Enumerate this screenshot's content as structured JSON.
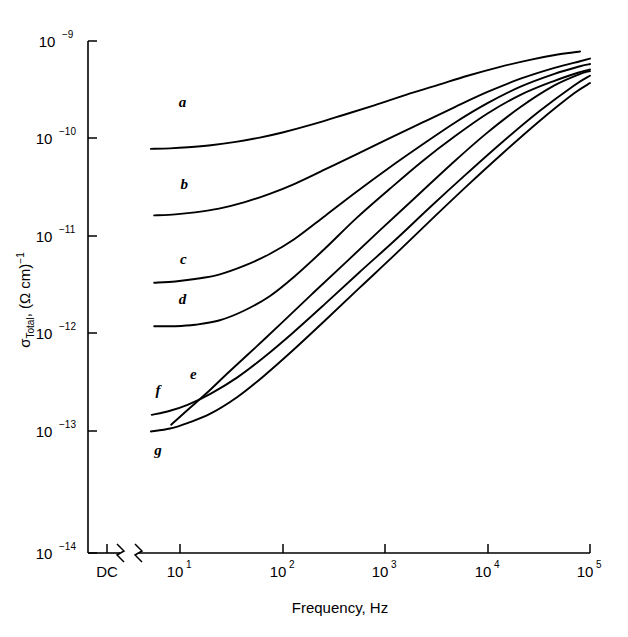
{
  "figure": {
    "background": "#ffffff",
    "ink_color": "#000000"
  },
  "axes": {
    "y_title_main": "σ",
    "y_title_sub": "Total",
    "y_title_rest": ", (Ω  cm)",
    "y_title_exp": "−1",
    "x_title": "Frequency, Hz",
    "dc_label": "DC"
  },
  "chart_data": {
    "type": "line",
    "title": "",
    "xlabel": "Frequency, Hz",
    "ylabel": "σ Total, (Ω cm)⁻¹",
    "x_scale": "log",
    "y_scale": "log",
    "xlim": [
      4,
      100000
    ],
    "ylim": [
      1e-14,
      1e-09
    ],
    "grid": false,
    "legend": "inline-curve-labels",
    "has_axis_break": true,
    "axis_break_note": "broken x-axis between DC point and log frequency decades",
    "x_ticks": [
      {
        "label_mantissa": "10",
        "label_exp": "1",
        "value": 10
      },
      {
        "label_mantissa": "10",
        "label_exp": "2",
        "value": 100
      },
      {
        "label_mantissa": "10",
        "label_exp": "3",
        "value": 1000
      },
      {
        "label_mantissa": "10",
        "label_exp": "4",
        "value": 10000
      },
      {
        "label_mantissa": "10",
        "label_exp": "5",
        "value": 100000
      }
    ],
    "y_ticks": [
      {
        "label_mantissa": "10",
        "label_exp": "−9",
        "value": 1e-09
      },
      {
        "label_mantissa": "10",
        "label_exp": "−10",
        "value": 1e-10
      },
      {
        "label_mantissa": "10",
        "label_exp": "−11",
        "value": 1e-11
      },
      {
        "label_mantissa": "10",
        "label_exp": "−12",
        "value": 1e-12
      },
      {
        "label_mantissa": "10",
        "label_exp": "−13",
        "value": 1e-13
      },
      {
        "label_mantissa": "10",
        "label_exp": "−14",
        "value": 1e-14
      }
    ],
    "series": [
      {
        "name": "a",
        "label": "a",
        "label_x": 10.6,
        "label_y": 2.1e-10,
        "x": [
          5.2,
          8,
          12,
          20,
          35,
          60,
          100,
          200,
          400,
          800,
          1600,
          3200,
          6400,
          13000,
          26000,
          50000,
          80000
        ],
        "y": [
          7.8e-11,
          7.9e-11,
          8.1e-11,
          8.5e-11,
          9.2e-11,
          1.02e-10,
          1.15e-10,
          1.4e-10,
          1.75e-10,
          2.2e-10,
          2.8e-10,
          3.5e-10,
          4.4e-10,
          5.4e-10,
          6.4e-10,
          7.3e-10,
          7.8e-10
        ]
      },
      {
        "name": "b",
        "label": "b",
        "label_x": 11.0,
        "label_y": 3e-11,
        "x": [
          5.6,
          9,
          14,
          24,
          42,
          75,
          130,
          260,
          520,
          1100,
          2300,
          4800,
          10000,
          21000,
          45000,
          80000,
          100000
        ],
        "y": [
          1.62e-11,
          1.66e-11,
          1.74e-11,
          1.9e-11,
          2.2e-11,
          2.7e-11,
          3.4e-11,
          4.8e-11,
          6.8e-11,
          1e-10,
          1.45e-10,
          2.1e-10,
          3e-10,
          4.1e-10,
          5.3e-10,
          6.2e-10,
          6.6e-10
        ]
      },
      {
        "name": "c",
        "label": "c",
        "label_x": 10.8,
        "label_y": 5.2e-12,
        "x": [
          5.6,
          9,
          14,
          24,
          42,
          75,
          130,
          260,
          520,
          1100,
          2300,
          4800,
          10000,
          21000,
          45000,
          80000,
          100000
        ],
        "y": [
          3.3e-12,
          3.4e-12,
          3.6e-12,
          4e-12,
          4.9e-12,
          6.5e-12,
          9.2e-12,
          1.6e-11,
          2.8e-11,
          5e-11,
          8.6e-11,
          1.45e-10,
          2.3e-10,
          3.4e-10,
          4.6e-10,
          5.5e-10,
          5.8e-10
        ]
      },
      {
        "name": "d",
        "label": "d",
        "label_x": 10.6,
        "label_y": 2e-12,
        "x": [
          5.6,
          9,
          14,
          24,
          42,
          75,
          130,
          260,
          520,
          1100,
          2300,
          4800,
          10000,
          21000,
          45000,
          80000,
          100000
        ],
        "y": [
          1.18e-12,
          1.18e-12,
          1.22e-12,
          1.35e-12,
          1.7e-12,
          2.4e-12,
          3.8e-12,
          7.4e-12,
          1.5e-11,
          3e-11,
          5.8e-11,
          1.05e-10,
          1.8e-10,
          2.8e-10,
          3.9e-10,
          4.8e-10,
          5.1e-10
        ]
      },
      {
        "name": "e",
        "label": "e",
        "label_x": 13.5,
        "label_y": 3.4e-13,
        "x": [
          8.2,
          12,
          18,
          30,
          55,
          100,
          200,
          420,
          900,
          2000,
          4400,
          9500,
          21000,
          45000,
          85000,
          100000
        ],
        "y": [
          1.15e-13,
          1.65e-13,
          2.4e-13,
          4e-13,
          7.2e-13,
          1.3e-12,
          2.6e-12,
          5.4e-12,
          1.15e-11,
          2.5e-11,
          5.4e-11,
          1.1e-10,
          2.1e-10,
          3.5e-10,
          4.7e-10,
          4.9e-10
        ]
      },
      {
        "name": "f",
        "label": "f",
        "label_x": 6.1,
        "label_y": 2.3e-13,
        "x": [
          5.3,
          8,
          12,
          20,
          36,
          65,
          125,
          260,
          560,
          1250,
          2800,
          6200,
          14000,
          32000,
          70000,
          100000
        ],
        "y": [
          1.45e-13,
          1.6e-13,
          1.85e-13,
          2.4e-13,
          3.5e-13,
          5.6e-13,
          1e-12,
          2e-12,
          4.2e-12,
          9e-12,
          2e-11,
          4.3e-11,
          9.2e-11,
          1.9e-10,
          3.5e-10,
          4.4e-10
        ]
      },
      {
        "name": "g",
        "label": "g",
        "label_x": 6.1,
        "label_y": 5.6e-14,
        "x": [
          5.2,
          8,
          12,
          20,
          36,
          65,
          125,
          260,
          560,
          1250,
          2800,
          6200,
          14000,
          32000,
          70000,
          100000
        ],
        "y": [
          9.8e-14,
          1.05e-13,
          1.2e-13,
          1.5e-13,
          2.2e-13,
          3.6e-13,
          6.6e-13,
          1.35e-12,
          2.9e-12,
          6.4e-12,
          1.45e-11,
          3.2e-11,
          7e-11,
          1.5e-10,
          2.9e-10,
          3.7e-10
        ]
      }
    ]
  },
  "caption": {
    "partial_text": ""
  }
}
